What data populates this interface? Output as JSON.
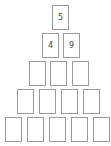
{
  "pyramid": {
    "rows": [
      {
        "cells": [
          {
            "value": "5"
          }
        ]
      },
      {
        "cells": [
          {
            "value": "4"
          },
          {
            "value": "9"
          }
        ]
      },
      {
        "cells": [
          {
            "value": ""
          },
          {
            "value": ""
          },
          {
            "value": ""
          }
        ]
      },
      {
        "cells": [
          {
            "value": ""
          },
          {
            "value": ""
          },
          {
            "value": ""
          },
          {
            "value": ""
          }
        ]
      },
      {
        "cells": [
          {
            "value": ""
          },
          {
            "value": ""
          },
          {
            "value": ""
          },
          {
            "value": ""
          },
          {
            "value": ""
          }
        ]
      }
    ]
  },
  "colors": {
    "card_border": "#9a9a9a",
    "card_text": "#444444",
    "background": "#ffffff"
  }
}
